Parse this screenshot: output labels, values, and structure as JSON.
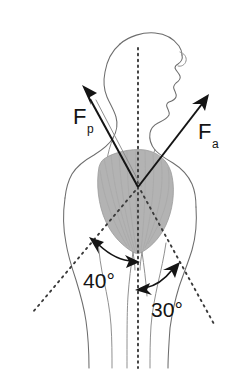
{
  "figure": {
    "background_color": "#ffffff",
    "outline_color": "#6d6d6d",
    "muscle_fill_color": "#b3b3b3",
    "vector_color": "#141414",
    "dashed_line_color": "#3a3a3a"
  },
  "vectors": [
    {
      "id": "posterior-force",
      "label_main": "F",
      "label_sub": "p",
      "label_full": "Fp",
      "direction": "up-left",
      "origin": {
        "x": 138,
        "y": 187
      },
      "tip": {
        "x": 84,
        "y": 88
      },
      "label_position": {
        "x": 74,
        "y": 121
      }
    },
    {
      "id": "anterior-force",
      "label_main": "F",
      "label_sub": "a",
      "label_full": "Fa",
      "direction": "up-right",
      "origin": {
        "x": 138,
        "y": 187
      },
      "tip": {
        "x": 207,
        "y": 97
      },
      "label_position": {
        "x": 200,
        "y": 136
      }
    }
  ],
  "angles": [
    {
      "id": "angle-left",
      "value": 40,
      "unit": "degrees",
      "label": "40°",
      "label_position": {
        "x": 99,
        "y": 281
      },
      "measured_from": "vertical-axis",
      "side": "left"
    },
    {
      "id": "angle-right",
      "value": 30,
      "unit": "degrees",
      "label": "30°",
      "label_position": {
        "x": 152,
        "y": 310
      },
      "measured_from": "vertical-axis",
      "side": "right"
    }
  ],
  "reference_lines": [
    {
      "id": "vertical-body-axis",
      "style": "dashed",
      "orientation": "vertical",
      "from": {
        "x": 138,
        "y": 48
      },
      "to": {
        "x": 138,
        "y": 368
      }
    },
    {
      "id": "left-abduction-line",
      "style": "dashed",
      "orientation": "diagonal-down-left",
      "from": {
        "x": 138,
        "y": 187
      },
      "to": {
        "x": 33,
        "y": 312
      }
    },
    {
      "id": "right-abduction-line",
      "style": "dashed",
      "orientation": "diagonal-down-right",
      "from": {
        "x": 138,
        "y": 187
      },
      "to": {
        "x": 214,
        "y": 324
      }
    }
  ],
  "anatomy": [
    {
      "id": "head",
      "label": "head-profile-facing-right"
    },
    {
      "id": "neck",
      "label": "neck"
    },
    {
      "id": "deltoid",
      "label": "shaded-deltoid-muscle"
    },
    {
      "id": "left-arm",
      "label": "left-arm-outline"
    },
    {
      "id": "right-arm",
      "label": "right-arm-outline"
    },
    {
      "id": "torso",
      "label": "torso-outline"
    }
  ]
}
